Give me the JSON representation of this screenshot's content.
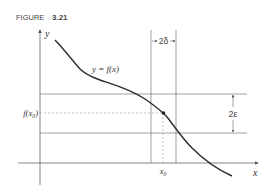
{
  "figure": {
    "label": "FIGURE",
    "number": "3.21"
  },
  "axes": {
    "x_label": "x",
    "y_label": "y"
  },
  "curve": {
    "label": "y = f(x)"
  },
  "annotations": {
    "delta_width": "2δ",
    "epsilon_height": "2ε",
    "fx0_label": "f(x₀)",
    "x0_label": "x₀"
  },
  "colors": {
    "line": "#555555",
    "curve": "#2a2a2a",
    "dashed": "#999999",
    "background": "#ffffff"
  }
}
